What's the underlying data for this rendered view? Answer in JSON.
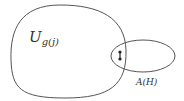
{
  "diagram": {
    "type": "set-diagram",
    "colors": {
      "stroke": "#555555",
      "text": "#333333",
      "node": "#222222",
      "background": "#ffffff"
    },
    "regions": [
      {
        "id": "U",
        "label_main": "U",
        "label_sub": "g(j)",
        "shape": "rounded-blob"
      },
      {
        "id": "A",
        "label": "A(H)",
        "shape": "ellipse"
      }
    ],
    "nodes": [
      {
        "id": "v1",
        "x": 120,
        "y": 52
      },
      {
        "id": "v2",
        "x": 120,
        "y": 59
      }
    ],
    "edges": [
      {
        "from": "v1",
        "to": "v2"
      }
    ]
  }
}
